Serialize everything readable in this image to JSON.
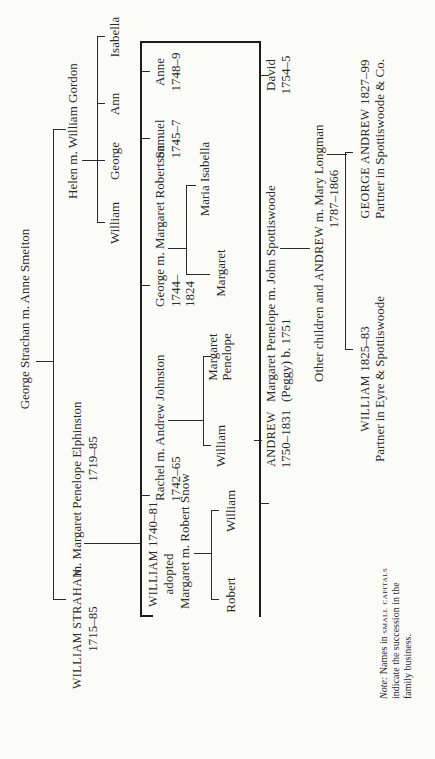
{
  "diagram": {
    "type": "family-tree",
    "orientation": "rotated-90-ccw",
    "root": {
      "couple": "George Strachan m. Anne Smeiton"
    },
    "generation_1": {
      "william_strahan": {
        "name": "WILLIAM STRAHAN",
        "dates": "1715–85",
        "spouse_text": "m. Margaret Penelope Elphinston",
        "spouse_dates": "1719–85"
      },
      "helen": {
        "couple": "Helen m. William Gordon"
      }
    },
    "gordon_children": [
      "William",
      "George",
      "Ann",
      "Isabella"
    ],
    "strahan_children": {
      "william": {
        "name": "WILLIAM",
        "dates": "1740–81",
        "note": "adopted",
        "couple": "Margaret m. Robert Snow"
      },
      "rachel": {
        "couple": "Rachel m. Andrew Johnston",
        "dates": "1742–65"
      },
      "george": {
        "couple": "George m. Margaret Robertson",
        "dates_line1": "1744–",
        "dates_line2": "1824"
      },
      "samuel": {
        "name": "Samuel",
        "dates": "1745–7"
      },
      "anne": {
        "name": "Anne",
        "dates": "1748–9"
      },
      "andrew": {
        "name": "ANDREW",
        "dates": "1750–1831"
      },
      "margaret_penelope": {
        "couple": "Margaret Penelope m. John Spottiswoode",
        "line2": "(Peggy) b. 1751"
      },
      "david": {
        "name": "David",
        "dates": "1754–5"
      }
    },
    "snow_children": [
      "Robert",
      "William"
    ],
    "johnston_children": [
      "William",
      "Margaret Penelope"
    ],
    "robertson_children": [
      "Margaret",
      "Maria Isabella"
    ],
    "spottiswoode_child": {
      "text": "Other children and ANDREW m. Mary Longman",
      "prefix": "Other children and",
      "name": "ANDREW",
      "suffix": "m. Mary Longman",
      "dates": "1787–1866"
    },
    "grandchildren": {
      "william": {
        "name": "WILLIAM",
        "dates": "1825–83",
        "role": "Partner in Eyre & Spottiswoode"
      },
      "george_andrew": {
        "name": "GEORGE ANDREW",
        "dates": "1827–99",
        "role": "Partner in Spottiswoode & Co."
      }
    },
    "note": {
      "label": "Note:",
      "line1_pre": "Names in",
      "line1_sc": "small capitals",
      "line2": "indicate the succession in the",
      "line3": "family business."
    }
  }
}
